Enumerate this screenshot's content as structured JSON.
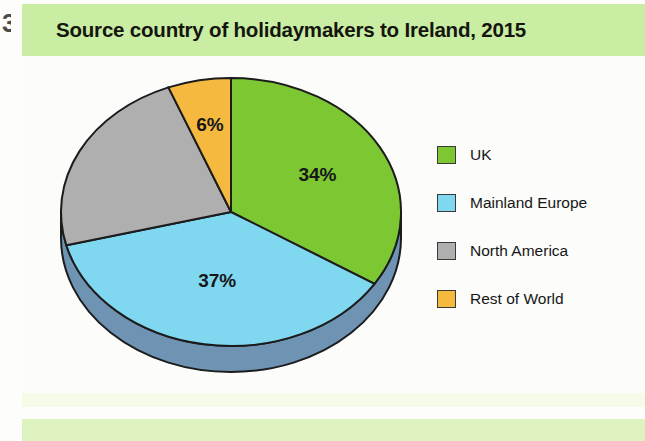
{
  "page": {
    "edge_artifact": "3",
    "background_color": "#fdfdfb"
  },
  "header": {
    "title": "Source country of holidaymakers to Ireland, 2015",
    "band_color": "#c9eda3",
    "text_color": "#15150f"
  },
  "legend": {
    "items": [
      {
        "label": "UK",
        "color": "#7dc832"
      },
      {
        "label": "Mainland Europe",
        "color": "#7fd7f0"
      },
      {
        "label": "North America",
        "color": "#afafaf"
      },
      {
        "label": "Rest of World",
        "color": "#f5b940"
      }
    ]
  },
  "chart_data": {
    "type": "pie",
    "title": "Source country of holidaymakers to Ireland, 2015",
    "xlabel": "",
    "ylabel": "",
    "unit": "%",
    "legend_position": "right",
    "start_angle_deg": 0,
    "direction": "clockwise",
    "three_d": true,
    "categories": [
      "UK",
      "Mainland Europe",
      "North America",
      "Rest of World"
    ],
    "values": [
      34,
      37,
      23,
      6
    ],
    "colors": [
      "#7dc832",
      "#7fd7f0",
      "#afafaf",
      "#f5b940"
    ],
    "data_labels": [
      "34%",
      "37%",
      "",
      "6%"
    ],
    "labels_shown": [
      "34%",
      "37%",
      "6%"
    ],
    "slice_labels": {
      "uk": "34%",
      "mainland_europe": "37%",
      "north_america": "",
      "rest_of_world": "6%"
    },
    "depth_color": "#6e93b3",
    "outline_color": "#1c1c1c"
  }
}
